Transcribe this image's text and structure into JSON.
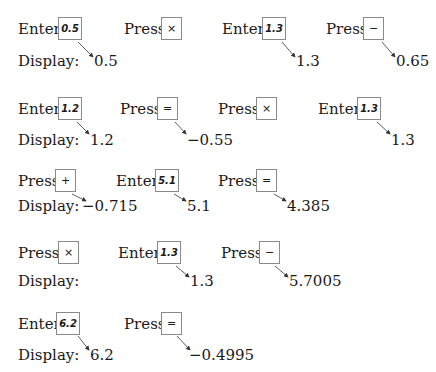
{
  "labels": {
    "enter": "Enter",
    "press": "Press",
    "press_colon": "Press:",
    "display": "Display:"
  },
  "rows": [
    {
      "steps": [
        {
          "action": "Enter",
          "key": "0.5",
          "display": "0.5"
        },
        {
          "action": "Press",
          "key": "×",
          "display": ""
        },
        {
          "action": "Enter",
          "key": "1.3",
          "display": "1.3"
        },
        {
          "action": "Press",
          "key": "−",
          "display": "0.65"
        }
      ]
    },
    {
      "steps": [
        {
          "action": "Enter",
          "key": "1.2",
          "display": "1.2"
        },
        {
          "action": "Press",
          "key": "=",
          "display": "−0.55"
        },
        {
          "action": "Press",
          "key": "×",
          "display": ""
        },
        {
          "action": "Enter",
          "key": "1.3",
          "display": "1.3"
        }
      ]
    },
    {
      "steps": [
        {
          "action": "Press",
          "key": "+",
          "display": "−0.715"
        },
        {
          "action": "Enter",
          "key": "5.1",
          "display": "5.1"
        },
        {
          "action": "Press",
          "key": "=",
          "display": "4.385"
        }
      ]
    },
    {
      "steps": [
        {
          "action": "Press:",
          "key": "×",
          "display": ""
        },
        {
          "action": "Enter",
          "key": "1.3",
          "display": "1.3"
        },
        {
          "action": "Press",
          "key": "−",
          "display": "5.7005"
        }
      ]
    },
    {
      "steps": [
        {
          "action": "Enter",
          "key": "6.2",
          "display": "6.2"
        },
        {
          "action": "Press",
          "key": "=",
          "display": "−0.4995"
        }
      ]
    }
  ]
}
